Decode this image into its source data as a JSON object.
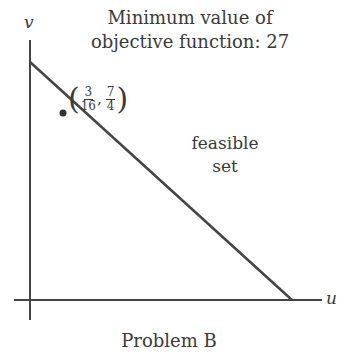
{
  "title": {
    "line1": "Minimum value of",
    "line2": "objective function: 27"
  },
  "axes": {
    "x_label": "u",
    "y_label": "v"
  },
  "region_label": {
    "line1": "feasible",
    "line2": "set"
  },
  "optimal_point": {
    "u_num": "3",
    "u_den": "16",
    "v_num": "7",
    "v_den": "4",
    "separator": ",",
    "open": "(",
    "close": ")"
  },
  "caption": "Problem B",
  "colors": {
    "line": "#444444",
    "text": "#3a3a3a"
  }
}
